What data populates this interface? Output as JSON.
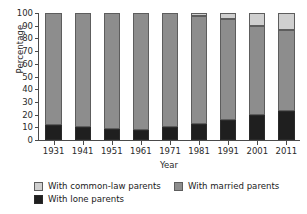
{
  "chart_data": {
    "type": "bar",
    "subtype": "stacked-100-percent",
    "title": "",
    "xlabel": "Year",
    "ylabel": "Percentage",
    "ylim": [
      0,
      100
    ],
    "yticks": [
      0,
      10,
      20,
      30,
      40,
      50,
      60,
      70,
      80,
      90,
      100
    ],
    "ytick_labels": [
      "0",
      "10",
      "20",
      "30",
      "40",
      "50",
      "60",
      "70",
      "80",
      "90",
      "100"
    ],
    "grid": false,
    "legend_position": "bottom-left",
    "categories": [
      "1931",
      "1941",
      "1951",
      "1961",
      "1971",
      "1981",
      "1991",
      "2001",
      "2011"
    ],
    "series": [
      {
        "name": "With lone parents",
        "color": "#1f1f1f",
        "values": [
          12,
          10,
          8.5,
          7.5,
          10,
          13,
          16,
          20,
          23
        ]
      },
      {
        "name": "With married parents",
        "color": "#8d8d8d",
        "values": [
          88,
          90,
          91.5,
          92.5,
          90,
          84.5,
          79,
          70,
          64
        ]
      },
      {
        "name": "With common-law parents",
        "color": "#cfcfcf",
        "values": [
          0,
          0,
          0,
          0,
          0,
          2.5,
          5,
          10,
          13
        ]
      }
    ],
    "stack_order_bottom_to_top": [
      "With lone parents",
      "With married parents",
      "With common-law parents"
    ],
    "annotations": []
  },
  "legend": {
    "items": [
      {
        "label": "With common-law parents",
        "color": "#cfcfcf"
      },
      {
        "label": "With married parents",
        "color": "#8d8d8d"
      },
      {
        "label": "With lone parents",
        "color": "#1f1f1f"
      }
    ]
  },
  "colors": {
    "common_law": "#cfcfcf",
    "married": "#8d8d8d",
    "lone": "#1f1f1f",
    "axis": "#4a4a4a",
    "background": "#ffffff"
  }
}
